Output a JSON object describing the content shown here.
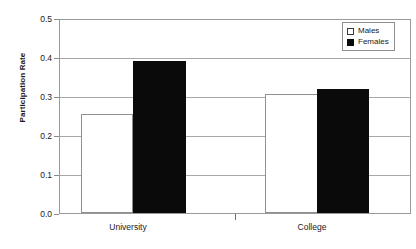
{
  "chart_data": {
    "type": "bar",
    "title": "",
    "xlabel": "",
    "ylabel": "Participation Rate",
    "categories": [
      "University",
      "College"
    ],
    "series": [
      {
        "name": "Males",
        "values": [
          0.257,
          0.308
        ],
        "color": "#ffffff"
      },
      {
        "name": "Females",
        "values": [
          0.393,
          0.32
        ],
        "color": "#0a0a0a"
      }
    ],
    "ylim": [
      0.0,
      0.5
    ],
    "yticks": [
      "0.0",
      "0.1",
      "0.2",
      "0.3",
      "0.4",
      "0.5"
    ],
    "ytick_values": [
      0.0,
      0.1,
      0.2,
      0.3,
      0.4,
      0.5
    ],
    "grid": true,
    "legend_position": "top-right",
    "legend_entries": [
      "Males",
      "Females"
    ]
  },
  "axis": {
    "y_title": "Participation Rate",
    "ticks": [
      {
        "label": "0.5",
        "value": 0.5
      },
      {
        "label": "0.4",
        "value": 0.4
      },
      {
        "label": "0.3",
        "value": 0.3
      },
      {
        "label": "0.2",
        "value": 0.2
      },
      {
        "label": "0.1",
        "value": 0.1
      },
      {
        "label": "0.0",
        "value": 0.0
      }
    ]
  },
  "categories": [
    {
      "label": "University"
    },
    {
      "label": "College"
    }
  ],
  "legend": {
    "items": [
      {
        "label": "Males"
      },
      {
        "label": "Females"
      }
    ]
  }
}
